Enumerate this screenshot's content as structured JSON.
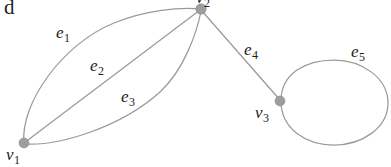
{
  "figure": {
    "panel_letter": "d",
    "caption_present": false,
    "background_color": "#ffffff",
    "edge_color": "#9a9a9a",
    "vertex_color": "#9d9d9d",
    "label_color": "#1d1d1d",
    "width": 391,
    "height": 167
  },
  "vertices": [
    {
      "id": "v1",
      "label_base": "v",
      "label_sub": "1",
      "x": 24,
      "y": 143,
      "r": 5.0,
      "label_x": 6,
      "label_y": 146
    },
    {
      "id": "v2",
      "label_base": "v",
      "label_sub": "2",
      "x": 201,
      "y": 9,
      "r": 5.2,
      "label_x": 196,
      "label_y": -11,
      "clipped_top": true
    },
    {
      "id": "v3",
      "label_base": "v",
      "label_sub": "3",
      "x": 280,
      "y": 101,
      "r": 5.0,
      "label_x": 255,
      "label_y": 104
    }
  ],
  "edges": [
    {
      "id": "e1",
      "label_base": "e",
      "label_sub": "1",
      "from": "v1",
      "to": "v2",
      "shape": "curve-upper",
      "label_x": 56,
      "label_y": 24
    },
    {
      "id": "e2",
      "label_base": "e",
      "label_sub": "2",
      "from": "v1",
      "to": "v2",
      "shape": "straight",
      "label_x": 90,
      "label_y": 57
    },
    {
      "id": "e3",
      "label_base": "e",
      "label_sub": "3",
      "from": "v1",
      "to": "v2",
      "shape": "curve-lower",
      "label_x": 121,
      "label_y": 88
    },
    {
      "id": "e4",
      "label_base": "e",
      "label_sub": "4",
      "from": "v2",
      "to": "v3",
      "shape": "straight",
      "label_x": 244,
      "label_y": 41
    },
    {
      "id": "e5",
      "label_base": "e",
      "label_sub": "5",
      "from": "v3",
      "to": "v3",
      "shape": "self-loop",
      "label_x": 351,
      "label_y": 43
    }
  ],
  "geometry": {
    "e1_path": "M 24 143 C 20 104, 62 44, 114 23 C 146 10, 180 7, 200 9",
    "e2_path": "M 24 143 L 200 10",
    "e3_path": "M 25 144 C 58 146, 120 128, 160 92 C 184 70, 197 32, 201 11",
    "e4_path": "M 202 11 L 280 100",
    "e5_path": "M 281 101 C 281 73, 306 60, 334 60 C 362 60, 388 78, 388 103 C 388 128, 362 145, 334 145 C 306 145, 281 129, 281 101 Z",
    "loop_center_x": 334,
    "loop_center_y": 103,
    "loop_rx": 54,
    "loop_ry": 42
  }
}
